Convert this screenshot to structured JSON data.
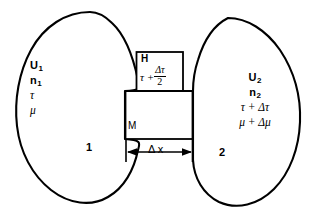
{
  "figure": {
    "background_color": "#ffffff",
    "line_color": "#000000"
  },
  "left_region": {
    "name": "reservoir-1",
    "index_label": "1",
    "variables": [
      {
        "symbol": "U",
        "subscript": "1",
        "text": "U"
      },
      {
        "symbol": "n",
        "subscript": "1",
        "text": "n"
      },
      {
        "symbol": "τ",
        "subscript": "",
        "text": "τ"
      },
      {
        "symbol": "μ",
        "subscript": "",
        "text": "μ"
      }
    ]
  },
  "right_region": {
    "name": "reservoir-2",
    "index_label": "2",
    "variables": [
      {
        "text": "U",
        "subscript": "2"
      },
      {
        "text": "n",
        "subscript": "2"
      },
      {
        "text": "τ + Δτ",
        "subscript": ""
      },
      {
        "text": "μ + Δμ",
        "subscript": ""
      }
    ]
  },
  "heat_box": {
    "name": "heat-reservoir",
    "title": "H",
    "temperature_prefix": "τ +",
    "temperature_numerator": "Δτ",
    "temperature_denominator": "2"
  },
  "membrane": {
    "name": "membrane",
    "label": "M"
  },
  "dimension": {
    "name": "thickness-dimension",
    "delta": "Δ",
    "variable": "x",
    "label": "Δ x"
  }
}
